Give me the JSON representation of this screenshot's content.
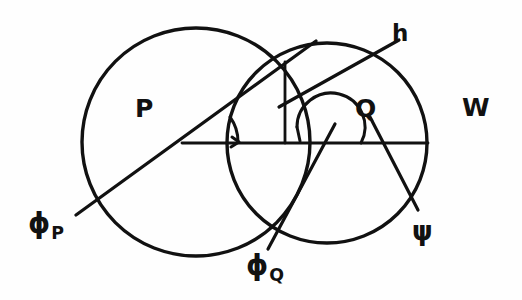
{
  "figure": {
    "background_color": "#fefefe",
    "ink_color": "#111111",
    "width": 522,
    "height": 300,
    "labels": {
      "circle_p": "P",
      "circle_q": "Q",
      "outer_region": "W",
      "height_segment": "h",
      "angle_phi_p_glyph": "ϕ",
      "angle_phi_p_subscript": "P",
      "angle_phi_q_glyph": "ϕ",
      "angle_phi_q_subscript": "Q",
      "angle_psi": "ψ"
    },
    "geometry": {
      "circle_p": {
        "cx": 196,
        "cy": 142,
        "r": 114
      },
      "circle_q": {
        "cx": 327,
        "cy": 143,
        "r": 100
      },
      "intersection_top": {
        "x": 285,
        "y": 62
      },
      "intersection_bottom": {
        "x": 283,
        "y": 232
      },
      "baseline": {
        "x1": 182,
        "y1": 143,
        "x2": 428,
        "y2": 143
      },
      "height_line": {
        "x1": 285,
        "y1": 62,
        "x2": 285,
        "y2": 143
      },
      "ray_h": {
        "x1": 279,
        "y1": 107,
        "x2": 399,
        "y2": 40
      },
      "ray_phi_p": {
        "x1": 316,
        "y1": 41,
        "x2": 76,
        "y2": 215
      },
      "ray_phi_q": {
        "x1": 327,
        "y1": 143,
        "x2": 268,
        "y2": 249
      },
      "ray_psi": {
        "x1": 327,
        "y1": 143,
        "x2": 418,
        "y2": 210
      },
      "arc_phi_p": {
        "cx": 196,
        "cy": 142,
        "r": 38,
        "from_deg": 0,
        "to_deg": 34
      },
      "arc_psi": {
        "cx": 327,
        "cy": 143,
        "r": 34,
        "from_deg": 0,
        "to_deg": 208
      }
    }
  }
}
